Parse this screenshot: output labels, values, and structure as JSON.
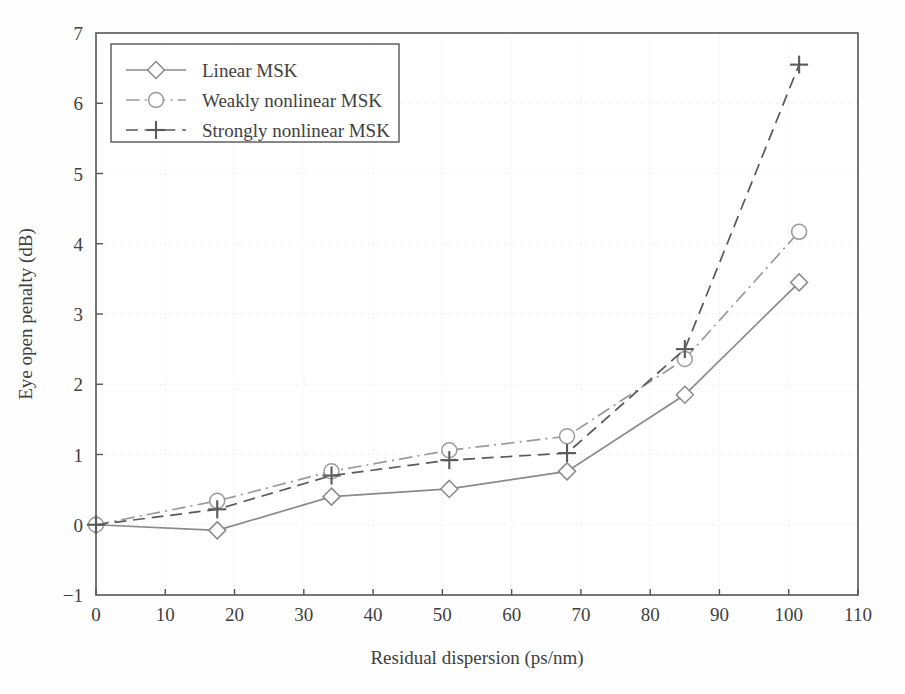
{
  "chart_data": {
    "type": "line",
    "title": "",
    "xlabel": "Residual dispersion (ps/nm)",
    "ylabel": "Eye open penalty (dB)",
    "xlim": [
      0,
      110
    ],
    "ylim": [
      -1,
      7
    ],
    "xticks": [
      "0",
      "10",
      "20",
      "30",
      "40",
      "50",
      "60",
      "70",
      "80",
      "90",
      "100",
      "110"
    ],
    "yticks": [
      "-1",
      "0",
      "1",
      "2",
      "3",
      "4",
      "5",
      "6",
      "7"
    ],
    "grid": true,
    "legend_position": "top-left",
    "x": [
      0,
      17.5,
      34,
      51,
      68,
      85,
      101.5
    ],
    "series": [
      {
        "name": "Linear MSK",
        "values": [
          0.0,
          -0.08,
          0.4,
          0.51,
          0.76,
          1.85,
          3.45
        ],
        "marker": "diamond",
        "linestyle": "solid",
        "color": "#8a8a8a"
      },
      {
        "name": "Weakly nonlinear MSK",
        "values": [
          0.0,
          0.34,
          0.76,
          1.06,
          1.26,
          2.36,
          4.17
        ],
        "marker": "circle",
        "linestyle": "dashdot",
        "color": "#9a9a9a"
      },
      {
        "name": "Strongly nonlinear MSK",
        "values": [
          0.0,
          0.22,
          0.7,
          0.92,
          1.02,
          2.5,
          6.55
        ],
        "marker": "plus",
        "linestyle": "dashed",
        "color": "#5a5a5a"
      }
    ]
  },
  "colors": {
    "background": "#fefefe",
    "axis": "#555555",
    "grid": "#e8e6e6",
    "text": "#3f3f3f"
  }
}
